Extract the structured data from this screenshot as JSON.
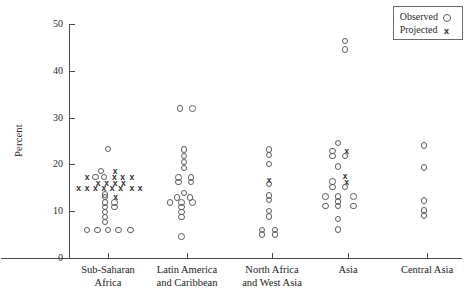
{
  "chart_data": {
    "type": "scatter",
    "title": "",
    "xlabel": "",
    "ylabel": "Percent",
    "ylim": [
      0,
      50
    ],
    "yticks": [
      0,
      10,
      20,
      30,
      40,
      50
    ],
    "grid": false,
    "legend_position": "top-right",
    "categories": [
      "Sub-Saharan\nAfrica",
      "Latin America\nand Caribbean",
      "North Africa\nand West Asia",
      "Asia",
      "Central Asia"
    ],
    "series": [
      {
        "name": "Observed",
        "marker": "o"
      },
      {
        "name": "Projected",
        "marker": "x"
      }
    ],
    "points": [
      {
        "category": 0,
        "value": 23.3,
        "series": "Observed",
        "offset": 0
      },
      {
        "category": 0,
        "value": 18.6,
        "series": "Observed",
        "offset": -1
      },
      {
        "category": 0,
        "value": 18.6,
        "series": "Projected",
        "offset": 1
      },
      {
        "category": 0,
        "value": 17.3,
        "series": "Projected",
        "offset": -3
      },
      {
        "category": 0,
        "value": 17.3,
        "series": "Observed",
        "offset": -1.8
      },
      {
        "category": 0,
        "value": 17.3,
        "series": "Observed",
        "offset": -0.6
      },
      {
        "category": 0,
        "value": 17.3,
        "series": "Projected",
        "offset": 0.9
      },
      {
        "category": 0,
        "value": 17.3,
        "series": "Projected",
        "offset": 2.1
      },
      {
        "category": 0,
        "value": 17.3,
        "series": "Projected",
        "offset": 3.4
      },
      {
        "category": 0,
        "value": 16.1,
        "series": "Projected",
        "offset": -1.4
      },
      {
        "category": 0,
        "value": 16.1,
        "series": "Projected",
        "offset": -0.2
      },
      {
        "category": 0,
        "value": 16.1,
        "series": "Projected",
        "offset": 1
      },
      {
        "category": 0,
        "value": 16.1,
        "series": "Projected",
        "offset": 2.2
      },
      {
        "category": 0,
        "value": 15.0,
        "series": "Projected",
        "offset": -4.2
      },
      {
        "category": 0,
        "value": 15.0,
        "series": "Projected",
        "offset": -3
      },
      {
        "category": 0,
        "value": 15.0,
        "series": "Projected",
        "offset": -1.8
      },
      {
        "category": 0,
        "value": 15.0,
        "series": "Projected",
        "offset": -0.6
      },
      {
        "category": 0,
        "value": 15.0,
        "series": "Projected",
        "offset": 0.6
      },
      {
        "category": 0,
        "value": 15.0,
        "series": "Projected",
        "offset": 1.8
      },
      {
        "category": 0,
        "value": 15.0,
        "series": "Projected",
        "offset": 3.4
      },
      {
        "category": 0,
        "value": 15.0,
        "series": "Projected",
        "offset": 4.6
      },
      {
        "category": 0,
        "value": 13.6,
        "series": "Observed",
        "offset": -0.4
      },
      {
        "category": 0,
        "value": 13.0,
        "series": "Observed",
        "offset": -0.4
      },
      {
        "category": 0,
        "value": 13.0,
        "series": "Projected",
        "offset": 1.1
      },
      {
        "category": 0,
        "value": 11.9,
        "series": "Observed",
        "offset": -0.4
      },
      {
        "category": 0,
        "value": 11.9,
        "series": "Observed",
        "offset": 0.9
      },
      {
        "category": 0,
        "value": 10.9,
        "series": "Observed",
        "offset": -0.4
      },
      {
        "category": 0,
        "value": 10.9,
        "series": "Observed",
        "offset": 0.9
      },
      {
        "category": 0,
        "value": 9.8,
        "series": "Observed",
        "offset": -0.4
      },
      {
        "category": 0,
        "value": 8.8,
        "series": "Observed",
        "offset": -0.4
      },
      {
        "category": 0,
        "value": 7.7,
        "series": "Observed",
        "offset": -0.4
      },
      {
        "category": 0,
        "value": 6.0,
        "series": "Observed",
        "offset": -3
      },
      {
        "category": 0,
        "value": 6.0,
        "series": "Observed",
        "offset": -1.5
      },
      {
        "category": 0,
        "value": 6.0,
        "series": "Observed",
        "offset": 0
      },
      {
        "category": 0,
        "value": 6.0,
        "series": "Observed",
        "offset": 1.5
      },
      {
        "category": 0,
        "value": 6.0,
        "series": "Observed",
        "offset": 3.2
      },
      {
        "category": 1,
        "value": 31.9,
        "series": "Observed",
        "offset": -1
      },
      {
        "category": 1,
        "value": 31.9,
        "series": "Observed",
        "offset": 0.8
      },
      {
        "category": 1,
        "value": 23.2,
        "series": "Observed",
        "offset": -0.4
      },
      {
        "category": 1,
        "value": 21.8,
        "series": "Observed",
        "offset": -0.4
      },
      {
        "category": 1,
        "value": 20.5,
        "series": "Observed",
        "offset": -0.4
      },
      {
        "category": 1,
        "value": 19.2,
        "series": "Observed",
        "offset": -0.4
      },
      {
        "category": 1,
        "value": 17.2,
        "series": "Observed",
        "offset": -1.2
      },
      {
        "category": 1,
        "value": 17.2,
        "series": "Observed",
        "offset": 0.6
      },
      {
        "category": 1,
        "value": 16.2,
        "series": "Observed",
        "offset": -1.2
      },
      {
        "category": 1,
        "value": 16.2,
        "series": "Observed",
        "offset": 0.6
      },
      {
        "category": 1,
        "value": 13.9,
        "series": "Observed",
        "offset": -0.4
      },
      {
        "category": 1,
        "value": 12.9,
        "series": "Observed",
        "offset": -1.4
      },
      {
        "category": 1,
        "value": 12.9,
        "series": "Observed",
        "offset": 0.4
      },
      {
        "category": 1,
        "value": 11.9,
        "series": "Observed",
        "offset": -2.4
      },
      {
        "category": 1,
        "value": 11.9,
        "series": "Observed",
        "offset": -0.8
      },
      {
        "category": 1,
        "value": 11.9,
        "series": "Observed",
        "offset": 0.8
      },
      {
        "category": 1,
        "value": 10.9,
        "series": "Observed",
        "offset": -0.8
      },
      {
        "category": 1,
        "value": 9.8,
        "series": "Observed",
        "offset": -0.8
      },
      {
        "category": 1,
        "value": 8.8,
        "series": "Observed",
        "offset": -0.8
      },
      {
        "category": 1,
        "value": 4.6,
        "series": "Observed",
        "offset": -0.8
      },
      {
        "category": 2,
        "value": 23.2,
        "series": "Observed",
        "offset": -0.4
      },
      {
        "category": 2,
        "value": 22.0,
        "series": "Observed",
        "offset": -0.4
      },
      {
        "category": 2,
        "value": 20.1,
        "series": "Observed",
        "offset": -0.4
      },
      {
        "category": 2,
        "value": 16.6,
        "series": "Projected",
        "offset": -0.4
      },
      {
        "category": 2,
        "value": 15.8,
        "series": "Observed",
        "offset": -0.4
      },
      {
        "category": 2,
        "value": 13.4,
        "series": "Observed",
        "offset": -0.4
      },
      {
        "category": 2,
        "value": 12.4,
        "series": "Observed",
        "offset": -0.4
      },
      {
        "category": 2,
        "value": 10.0,
        "series": "Observed",
        "offset": -0.4
      },
      {
        "category": 2,
        "value": 8.9,
        "series": "Observed",
        "offset": -0.4
      },
      {
        "category": 2,
        "value": 6.0,
        "series": "Observed",
        "offset": -1.4
      },
      {
        "category": 2,
        "value": 6.0,
        "series": "Observed",
        "offset": 0.4
      },
      {
        "category": 2,
        "value": 5.0,
        "series": "Observed",
        "offset": -1.4
      },
      {
        "category": 2,
        "value": 5.0,
        "series": "Observed",
        "offset": 0.4
      },
      {
        "category": 3,
        "value": 46.4,
        "series": "Observed",
        "offset": -0.4
      },
      {
        "category": 3,
        "value": 44.5,
        "series": "Observed",
        "offset": -0.4
      },
      {
        "category": 3,
        "value": 24.6,
        "series": "Observed",
        "offset": -1.4
      },
      {
        "category": 3,
        "value": 22.9,
        "series": "Observed",
        "offset": -2.2
      },
      {
        "category": 3,
        "value": 22.9,
        "series": "Projected",
        "offset": -0.2
      },
      {
        "category": 3,
        "value": 21.8,
        "series": "Observed",
        "offset": -2.2
      },
      {
        "category": 3,
        "value": 21.8,
        "series": "Observed",
        "offset": -0.4
      },
      {
        "category": 3,
        "value": 19.6,
        "series": "Observed",
        "offset": -1.4
      },
      {
        "category": 3,
        "value": 17.5,
        "series": "Projected",
        "offset": -0.4
      },
      {
        "category": 3,
        "value": 16.3,
        "series": "Observed",
        "offset": -2.2
      },
      {
        "category": 3,
        "value": 16.3,
        "series": "Projected",
        "offset": -0.2
      },
      {
        "category": 3,
        "value": 15.2,
        "series": "Observed",
        "offset": -2.2
      },
      {
        "category": 3,
        "value": 15.2,
        "series": "Observed",
        "offset": -0.4
      },
      {
        "category": 3,
        "value": 13.1,
        "series": "Observed",
        "offset": -3.2
      },
      {
        "category": 3,
        "value": 13.1,
        "series": "Observed",
        "offset": -1.4
      },
      {
        "category": 3,
        "value": 13.1,
        "series": "Observed",
        "offset": 0.8
      },
      {
        "category": 3,
        "value": 12.1,
        "series": "Observed",
        "offset": -1.4
      },
      {
        "category": 3,
        "value": 11.1,
        "series": "Observed",
        "offset": -3.2
      },
      {
        "category": 3,
        "value": 11.1,
        "series": "Observed",
        "offset": -1.4
      },
      {
        "category": 3,
        "value": 11.1,
        "series": "Observed",
        "offset": 0.8
      },
      {
        "category": 3,
        "value": 8.3,
        "series": "Observed",
        "offset": -1.4
      },
      {
        "category": 3,
        "value": 6.1,
        "series": "Observed",
        "offset": -1.4
      },
      {
        "category": 4,
        "value": 24.1,
        "series": "Observed",
        "offset": -0.4
      },
      {
        "category": 4,
        "value": 19.4,
        "series": "Observed",
        "offset": -0.4
      },
      {
        "category": 4,
        "value": 12.3,
        "series": "Observed",
        "offset": -0.4
      },
      {
        "category": 4,
        "value": 10.2,
        "series": "Observed",
        "offset": -0.4
      },
      {
        "category": 4,
        "value": 9.1,
        "series": "Observed",
        "offset": -0.4
      }
    ]
  },
  "legend": {
    "observed_label": "Observed",
    "projected_label": "Projected",
    "observed_symbol": "o",
    "projected_symbol": "x"
  },
  "axis": {
    "y_title": "Percent"
  }
}
